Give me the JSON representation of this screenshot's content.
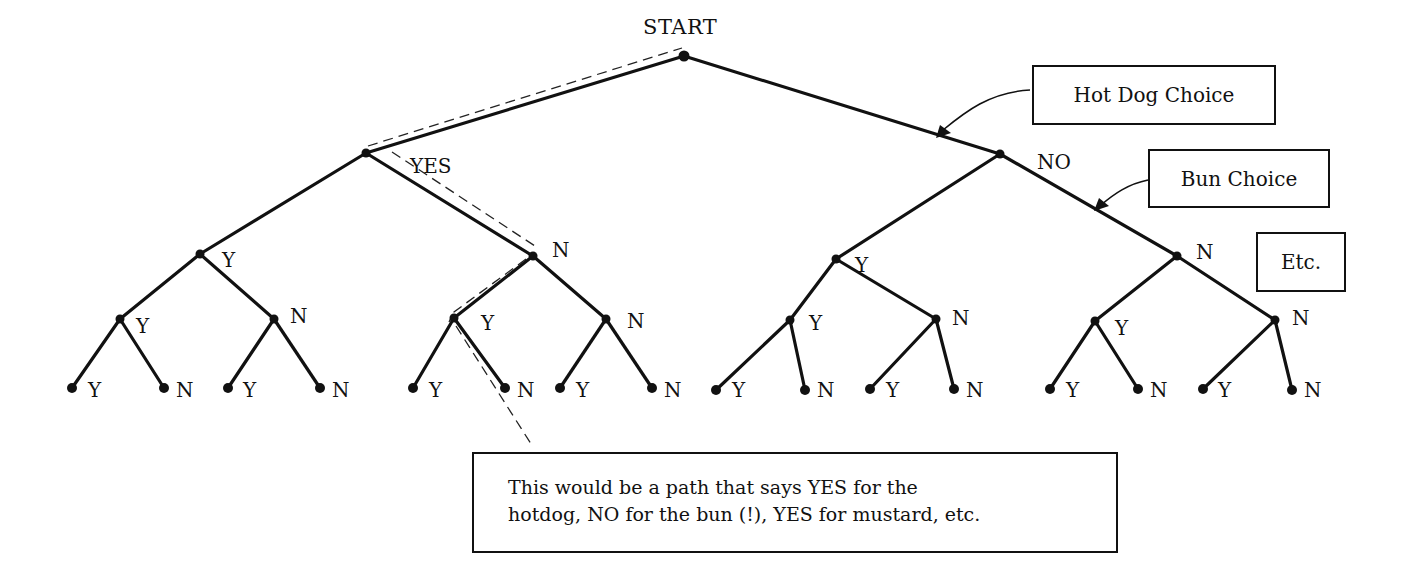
{
  "diagram": {
    "type": "binary-decision-tree",
    "root_label": "START",
    "level1_labels": {
      "left": "YES",
      "right": "NO"
    },
    "branch_yes": "Y",
    "branch_no": "N",
    "callouts": {
      "hot_dog_choice": "Hot Dog Choice",
      "bun_choice": "Bun Choice",
      "etc": "Etc."
    },
    "note": {
      "line1": "This would be a path that says YES for the",
      "line2": "hotdog, NO for the bun (!), YES for mustard, etc."
    },
    "highlighted_path": [
      "START",
      "YES",
      "N",
      "Y",
      "N"
    ],
    "levels": [
      {
        "level": 0,
        "nodes": [
          "START"
        ]
      },
      {
        "level": 1,
        "nodes": [
          "YES",
          "NO"
        ]
      },
      {
        "level": 2,
        "nodes": [
          "Y",
          "N",
          "Y",
          "N"
        ]
      },
      {
        "level": 3,
        "nodes": [
          "Y",
          "N",
          "Y",
          "N",
          "Y",
          "N",
          "Y",
          "N"
        ]
      },
      {
        "level": 4,
        "nodes": [
          "Y",
          "N",
          "Y",
          "N",
          "Y",
          "N",
          "Y",
          "N",
          "Y",
          "N",
          "Y",
          "N",
          "Y",
          "N",
          "Y",
          "N"
        ]
      }
    ]
  },
  "labels": {
    "l2": [
      "Y",
      "N",
      "Y",
      "N"
    ],
    "l3": [
      "Y",
      "N",
      "Y",
      "N",
      "Y",
      "N",
      "Y",
      "N"
    ],
    "l4": [
      "Y",
      "N",
      "Y",
      "N",
      "Y",
      "N",
      "Y",
      "N",
      "Y",
      "N",
      "Y",
      "N",
      "Y",
      "N",
      "Y",
      "N"
    ]
  }
}
